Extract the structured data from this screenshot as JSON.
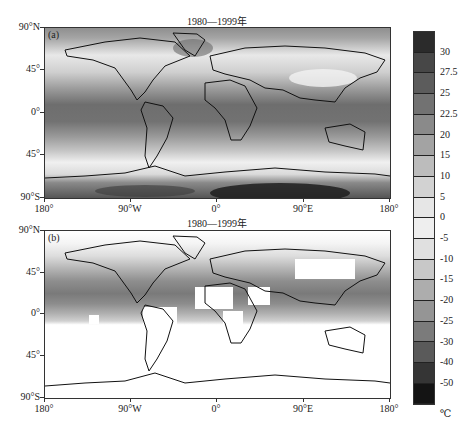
{
  "chart_data": [
    {
      "type": "heatmap",
      "panel": "(a)",
      "title": "1980—1999年",
      "subject": "Global surface air temperature climatology (filled contours) over world map",
      "xlabel": "",
      "ylabel": "",
      "x_ticks": [
        "180°",
        "90°W",
        "0°",
        "90°E",
        "180°"
      ],
      "y_ticks": [
        "90°N",
        "45°",
        "0°",
        "45°",
        "90°S"
      ],
      "xlim": [
        -180,
        180
      ],
      "ylim": [
        -90,
        90
      ],
      "grid": false,
      "coverage": "full global field",
      "features": {
        "tropics_0_to_20": "22.5–30 °C band",
        "midlatitude_45": "5–15 °C",
        "high_north_latitudes": "-10 to -25 °C (Greenland, Arctic)",
        "antarctica": "-30 to -50 °C (darkest near 90°E, ~75°S)",
        "tibetan_plateau": "near 0 to -5 °C"
      }
    },
    {
      "type": "heatmap",
      "panel": "(b)",
      "title": "1980—1999年",
      "subject": "Observed surface temperature field with missing data (white) over world map",
      "x_ticks": [
        "180°",
        "90°W",
        "0°",
        "90°E",
        "180°"
      ],
      "y_ticks": [
        "90°N",
        "45°",
        "0°",
        "45°",
        "90°S"
      ],
      "xlim": [
        -180,
        180
      ],
      "ylim": [
        -90,
        90
      ],
      "grid": false,
      "coverage": "partial; white boxes = missing data (Sahara, Amazon, central Africa, Australia interior, Arabia, southern oceans south of ~45°S, Antarctica)"
    }
  ],
  "colorbar": {
    "unit": "℃",
    "levels": [
      "30",
      "27.5",
      "25",
      "22.5",
      "20",
      "15",
      "10",
      "5",
      "0",
      "-5",
      "-10",
      "-15",
      "-20",
      "-25",
      "-30",
      "-40",
      "-50"
    ],
    "colors": [
      "#2b2b2b",
      "#474747",
      "#5c5c5c",
      "#727272",
      "#8a8a8a",
      "#a3a3a3",
      "#bcbcbc",
      "#d2d2d2",
      "#e6e6e6",
      "#eeeeee",
      "#e0e0e0",
      "#c8c8c8",
      "#adadad",
      "#959595",
      "#7b7b7b",
      "#5a5a5a",
      "#353535",
      "#141414"
    ]
  },
  "panels": {
    "a": {
      "title": "1980—1999年",
      "letter": "(a)"
    },
    "b": {
      "title": "1980—1999年",
      "letter": "(b)"
    }
  },
  "axes": {
    "y": [
      "90°N",
      "45°",
      "0°",
      "45°",
      "90°S"
    ],
    "x": [
      "180°",
      "90°W",
      "0°",
      "90°E",
      "180°"
    ]
  }
}
